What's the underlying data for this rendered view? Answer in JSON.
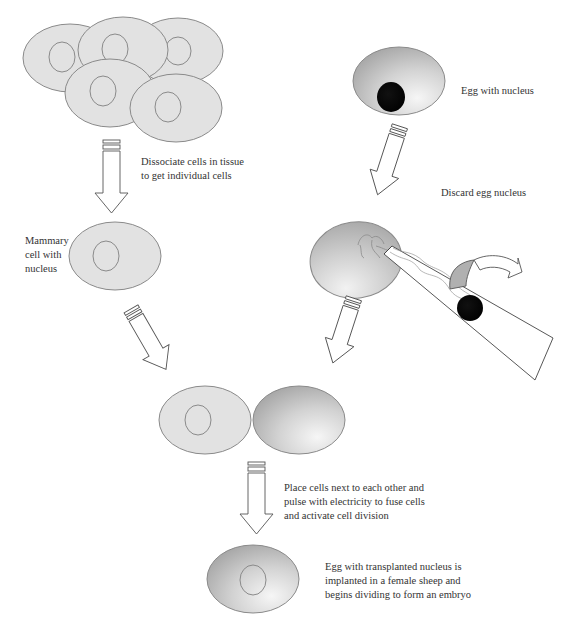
{
  "diagram": {
    "colors": {
      "cell_fill": "#e2e2e2",
      "cell_stroke": "#8a8a8a",
      "egg_gradient_light": "#f4f4f4",
      "egg_gradient_dark": "#a9a9a9",
      "nucleus_dark": "#000000",
      "arrow_stroke": "#555555",
      "text": "#333333"
    },
    "labels": {
      "dissociate": "Dissociate cells in tissue\nto get individual cells",
      "mammary": "Mammary\ncell  with\nnucleus",
      "egg_with_nucleus": "Egg with nucleus",
      "discard": "Discard egg nucleus",
      "fuse": "Place cells next to each other and\npulse with electricity to fuse cells\nand activate cell division",
      "implant": "Egg with transplanted nucleus is\nimplanted in a female sheep and\nbegins dividing to form an embryo"
    },
    "nodes": [
      {
        "id": "tissue",
        "desc": "Cluster of five mammary tissue cells with nuclei"
      },
      {
        "id": "mammary-cell",
        "desc": "Single mammary cell with nucleus"
      },
      {
        "id": "egg",
        "desc": "Egg cell with dark nucleus"
      },
      {
        "id": "enucleation",
        "desc": "Micropipette removing egg nucleus"
      },
      {
        "id": "fusion",
        "desc": "Mammary cell placed next to enucleated egg"
      },
      {
        "id": "embryo",
        "desc": "Egg with transplanted nucleus"
      }
    ],
    "edges": [
      {
        "from": "tissue",
        "to": "mammary-cell"
      },
      {
        "from": "egg",
        "to": "enucleation"
      },
      {
        "from": "mammary-cell",
        "to": "fusion"
      },
      {
        "from": "enucleation",
        "to": "fusion"
      },
      {
        "from": "fusion",
        "to": "embryo"
      }
    ]
  }
}
